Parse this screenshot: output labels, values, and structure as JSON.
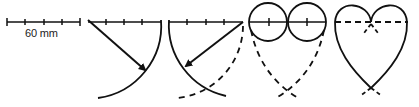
{
  "diagram": {
    "scale_label": "60 mm",
    "steps": [
      {
        "id": 1,
        "description": "Scale bar 60 mm divided into 4 segments"
      },
      {
        "id": 2,
        "description": "Arc swung from left end with radius equal to line length (arrow)"
      },
      {
        "id": 3,
        "description": "Arc swung from right end (arrow), dashed continuation"
      },
      {
        "id": 4,
        "description": "Two circles drawn on the line halves, dashed arcs cross below"
      },
      {
        "id": 5,
        "description": "Completed heart outline with dashed construction line"
      }
    ],
    "colors": {
      "stroke": "#111111",
      "background": "#ffffff"
    }
  }
}
